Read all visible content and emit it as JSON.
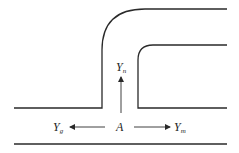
{
  "diagram": {
    "colors": {
      "line": "#2a2a2a",
      "background": "#ffffff"
    },
    "labels": {
      "origin": {
        "main": "A",
        "sub": ""
      },
      "up": {
        "main": "Y",
        "sub": "n"
      },
      "left": {
        "main": "Y",
        "sub": "g"
      },
      "right": {
        "main": "Y",
        "sub": "m"
      }
    },
    "arrows": [
      {
        "from": "A",
        "to": "Y_n",
        "direction": "up"
      },
      {
        "from": "A",
        "to": "Y_g",
        "direction": "left"
      },
      {
        "from": "A",
        "to": "Y_m",
        "direction": "right"
      }
    ]
  }
}
